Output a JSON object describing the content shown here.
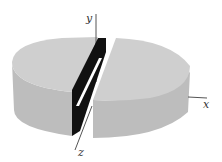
{
  "figure": {
    "axes": {
      "x": {
        "label": "x"
      },
      "y": {
        "label": "y"
      },
      "z": {
        "label": "z"
      }
    },
    "colors": {
      "cylinder_top": "#cfcfcf",
      "cylinder_side": "#bdbdbd",
      "slab": "#111111",
      "slit": "#ffffff",
      "axis": "#555555"
    }
  }
}
